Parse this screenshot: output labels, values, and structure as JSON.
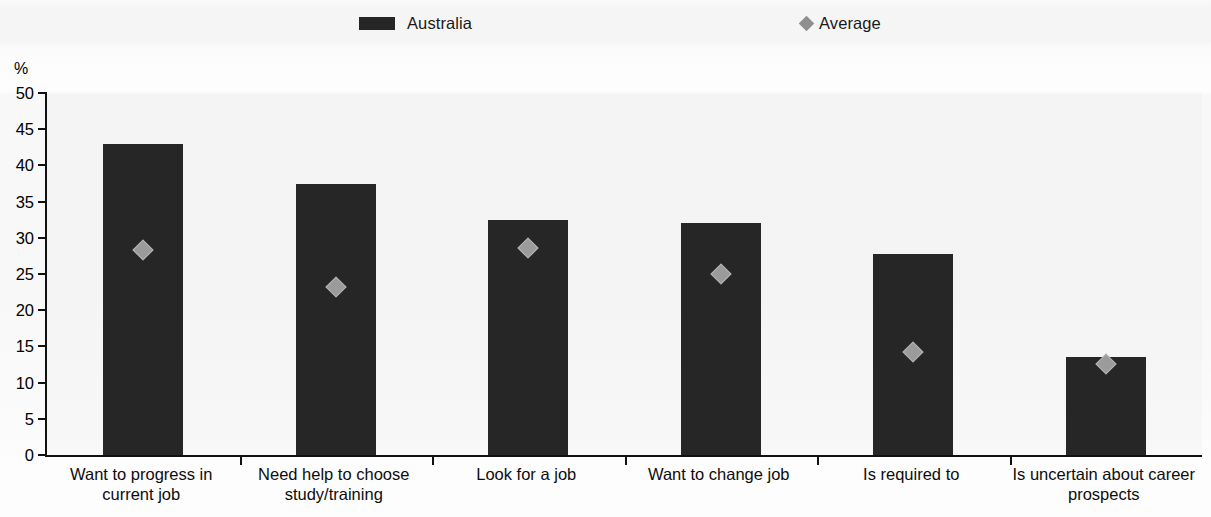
{
  "legend": {
    "entries": [
      {
        "label": "Australia",
        "marker": "bar-swatch-icon",
        "color": "#262626"
      },
      {
        "label": "Average",
        "marker": "diamond-marker-icon",
        "color": "#9b9b9b"
      }
    ]
  },
  "axis": {
    "y_unit": "%",
    "y_ticks": [
      "50",
      "45",
      "40",
      "35",
      "30",
      "25",
      "20",
      "15",
      "10",
      "5",
      "0"
    ]
  },
  "chart_data": {
    "type": "bar",
    "title": "",
    "xlabel": "",
    "ylabel": "%",
    "ylim": [
      0,
      50
    ],
    "ytick_step": 5,
    "grid": false,
    "legend_position": "top",
    "categories": [
      "Want to progress in current job",
      "Need help to choose study/training",
      "Look for a job",
      "Want to change job",
      "Is required to",
      "Is uncertain about career prospects"
    ],
    "series": [
      {
        "name": "Australia",
        "type": "bar",
        "color": "#262626",
        "values": [
          43.0,
          37.5,
          32.5,
          32.0,
          27.7,
          13.6
        ]
      },
      {
        "name": "Average",
        "type": "scatter",
        "marker": "diamond",
        "color": "#9b9b9b",
        "values": [
          29.3,
          24.3,
          29.6,
          26.1,
          15.3,
          13.6
        ]
      }
    ]
  }
}
